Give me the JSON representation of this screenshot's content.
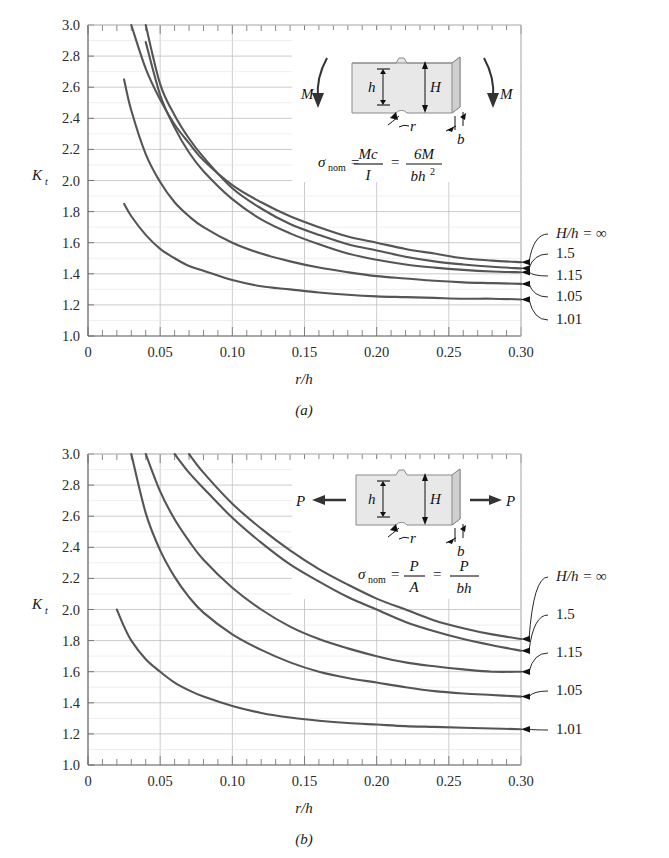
{
  "figure": {
    "panels": [
      {
        "id": "a",
        "caption": "(a)",
        "axis": {
          "xlabel": "r/h",
          "ylabel_main": "K",
          "ylabel_sub": "t",
          "xticks": [
            "0",
            "0.05",
            "0.10",
            "0.15",
            "0.20",
            "0.25",
            "0.30"
          ],
          "xtick_values": [
            0,
            0.05,
            0.1,
            0.15,
            0.2,
            0.25,
            0.3
          ],
          "yticks": [
            "1.0",
            "1.2",
            "1.4",
            "1.6",
            "1.8",
            "2.0",
            "2.2",
            "2.4",
            "2.6",
            "2.8",
            "3.0"
          ],
          "ytick_values": [
            1.0,
            1.2,
            1.4,
            1.6,
            1.8,
            2.0,
            2.2,
            2.4,
            2.6,
            2.8,
            3.0
          ],
          "xlim": [
            0,
            0.3
          ],
          "ylim": [
            1.0,
            3.0
          ]
        },
        "inset": {
          "load_label_left": "M",
          "load_label_right": "M",
          "dim_h": "h",
          "dim_H": "H",
          "dim_r": "r",
          "dim_b": "b",
          "formula": {
            "sigma": "σ",
            "sub": "nom",
            "eq1": "=",
            "num1": "Mc",
            "den1": "I",
            "eq2": "=",
            "num2": "6M",
            "den2_b": "bh",
            "den2_exp": "2"
          }
        },
        "curve_labels": [
          {
            "text": "H/h = ∞",
            "value": "inf"
          },
          {
            "text": "1.5",
            "value": "1.5"
          },
          {
            "text": "1.15",
            "value": "1.15"
          },
          {
            "text": "1.05",
            "value": "1.05"
          },
          {
            "text": "1.01",
            "value": "1.01"
          }
        ]
      },
      {
        "id": "b",
        "caption": "(b)",
        "axis": {
          "xlabel": "r/h",
          "ylabel_main": "K",
          "ylabel_sub": "t",
          "xticks": [
            "0",
            "0.05",
            "0.10",
            "0.15",
            "0.20",
            "0.25",
            "0.30"
          ],
          "xtick_values": [
            0,
            0.05,
            0.1,
            0.15,
            0.2,
            0.25,
            0.3
          ],
          "yticks": [
            "1.0",
            "1.2",
            "1.4",
            "1.6",
            "1.8",
            "2.0",
            "2.2",
            "2.4",
            "2.6",
            "2.8",
            "3.0"
          ],
          "ytick_values": [
            1.0,
            1.2,
            1.4,
            1.6,
            1.8,
            2.0,
            2.2,
            2.4,
            2.6,
            2.8,
            3.0
          ],
          "xlim": [
            0,
            0.3
          ],
          "ylim": [
            1.0,
            3.0
          ]
        },
        "inset": {
          "load_label_left": "P",
          "load_label_right": "P",
          "dim_h": "h",
          "dim_H": "H",
          "dim_r": "r",
          "dim_b": "b",
          "formula": {
            "sigma": "σ",
            "sub": "nom",
            "eq1": "=",
            "num1": "P",
            "den1": "A",
            "eq2": "=",
            "num2": "P",
            "den2_b": "bh",
            "den2_exp": ""
          }
        },
        "curve_labels": [
          {
            "text": "H/h = ∞",
            "value": "inf"
          },
          {
            "text": "1.5",
            "value": "1.5"
          },
          {
            "text": "1.15",
            "value": "1.15"
          },
          {
            "text": "1.05",
            "value": "1.05"
          },
          {
            "text": "1.01",
            "value": "1.01"
          }
        ]
      }
    ]
  },
  "colors": {
    "curve": "#555555",
    "grid_major": "#bfbfbf",
    "grid_minor": "#e2e2e2",
    "axis": "#6b6b6b",
    "text": "#1a1a1a",
    "inset_fill": "#e8e8e8",
    "inset_edge": "#8a8a8a"
  },
  "chart_data": [
    {
      "type": "line",
      "title": "(a) Notched rectangular bar in bending",
      "xlabel": "r/h",
      "ylabel": "Kt",
      "xlim": [
        0,
        0.3
      ],
      "ylim": [
        1.0,
        3.0
      ],
      "grid": true,
      "legend_position": "right-outside",
      "x": [
        0.02,
        0.025,
        0.03,
        0.04,
        0.05,
        0.06,
        0.07,
        0.08,
        0.1,
        0.12,
        0.14,
        0.16,
        0.18,
        0.2,
        0.22,
        0.24,
        0.26,
        0.28,
        0.3
      ],
      "series": [
        {
          "name": "H/h = ∞",
          "values": [
            null,
            null,
            3.0,
            2.72,
            2.52,
            2.36,
            2.24,
            2.13,
            1.97,
            1.86,
            1.77,
            1.7,
            1.64,
            1.6,
            1.56,
            1.53,
            1.5,
            1.485,
            1.475
          ]
        },
        {
          "name": "1.5",
          "values": [
            null,
            null,
            null,
            3.0,
            2.62,
            2.42,
            2.27,
            2.15,
            1.95,
            1.82,
            1.72,
            1.65,
            1.59,
            1.55,
            1.51,
            1.48,
            1.46,
            1.445,
            1.435
          ]
        },
        {
          "name": "1.15",
          "values": [
            null,
            null,
            null,
            2.89,
            2.55,
            2.34,
            2.18,
            2.06,
            1.88,
            1.75,
            1.66,
            1.59,
            1.53,
            1.49,
            1.46,
            1.44,
            1.425,
            1.415,
            1.41
          ]
        },
        {
          "name": "1.05",
          "values": [
            null,
            2.65,
            2.45,
            2.17,
            1.99,
            1.86,
            1.77,
            1.7,
            1.6,
            1.53,
            1.48,
            1.44,
            1.41,
            1.385,
            1.37,
            1.355,
            1.345,
            1.34,
            1.335
          ]
        },
        {
          "name": "1.01",
          "values": [
            null,
            1.85,
            1.77,
            1.65,
            1.56,
            1.5,
            1.45,
            1.42,
            1.36,
            1.32,
            1.3,
            1.28,
            1.265,
            1.255,
            1.25,
            1.245,
            1.24,
            1.24,
            1.235
          ]
        }
      ]
    },
    {
      "type": "line",
      "title": "(b) Notched rectangular bar in tension",
      "xlabel": "r/h",
      "ylabel": "Kt",
      "xlim": [
        0,
        0.3
      ],
      "ylim": [
        1.0,
        3.0
      ],
      "grid": true,
      "legend_position": "right-outside",
      "x": [
        0.02,
        0.025,
        0.03,
        0.04,
        0.05,
        0.06,
        0.07,
        0.08,
        0.1,
        0.12,
        0.14,
        0.16,
        0.18,
        0.2,
        0.22,
        0.24,
        0.26,
        0.28,
        0.3
      ],
      "series": [
        {
          "name": "H/h = ∞",
          "values": [
            null,
            null,
            null,
            null,
            null,
            null,
            3.0,
            2.88,
            2.68,
            2.52,
            2.38,
            2.26,
            2.16,
            2.07,
            2.0,
            1.93,
            1.88,
            1.84,
            1.81
          ]
        },
        {
          "name": "1.5",
          "values": [
            null,
            null,
            null,
            null,
            null,
            3.0,
            2.88,
            2.78,
            2.59,
            2.43,
            2.29,
            2.18,
            2.08,
            2.0,
            1.92,
            1.86,
            1.81,
            1.77,
            1.735
          ]
        },
        {
          "name": "1.15",
          "values": [
            null,
            null,
            null,
            3.0,
            2.76,
            2.58,
            2.44,
            2.32,
            2.14,
            2.0,
            1.89,
            1.81,
            1.75,
            1.7,
            1.66,
            1.635,
            1.615,
            1.6,
            1.6
          ]
        },
        {
          "name": "1.05",
          "values": [
            null,
            null,
            3.0,
            2.62,
            2.38,
            2.21,
            2.08,
            1.98,
            1.84,
            1.74,
            1.66,
            1.6,
            1.56,
            1.53,
            1.5,
            1.475,
            1.46,
            1.45,
            1.44
          ]
        },
        {
          "name": "1.01",
          "values": [
            2.0,
            1.89,
            1.8,
            1.68,
            1.6,
            1.53,
            1.48,
            1.44,
            1.38,
            1.335,
            1.305,
            1.285,
            1.27,
            1.26,
            1.25,
            1.245,
            1.24,
            1.235,
            1.23
          ]
        }
      ]
    }
  ]
}
